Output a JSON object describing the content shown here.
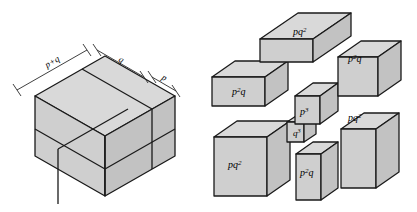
{
  "figure": {
    "colors": {
      "face_top": "#d9d9d9",
      "face_front": "#cfcfcf",
      "face_side": "#c2c2c2",
      "stroke": "#1a1a1a",
      "background": "#ffffff",
      "text": "#000000"
    }
  },
  "left_diagram": {
    "name": "subdivided-cube",
    "dimension_labels": [
      {
        "id": "edge-total",
        "text": "p+q",
        "position": "upper-left-edge"
      },
      {
        "id": "edge-q",
        "text": "q",
        "position": "upper-right-edge-long"
      },
      {
        "id": "edge-p",
        "text": "p",
        "position": "upper-right-edge-short"
      }
    ]
  },
  "right_diagram": {
    "name": "exploded-cube",
    "pieces": [
      {
        "id": "piece-top",
        "base": "pq",
        "exp": "2",
        "text": "pq2",
        "position": "top-center"
      },
      {
        "id": "piece-upper-right",
        "base": "p",
        "exp": "2",
        "text": "p2q",
        "position": "upper-right",
        "suffix": "q"
      },
      {
        "id": "piece-upper-left",
        "base": "p",
        "exp": "2",
        "text": "p2q",
        "position": "upper-left",
        "suffix": "q"
      },
      {
        "id": "piece-center-p3",
        "base": "p",
        "exp": "3",
        "text": "p3",
        "position": "center"
      },
      {
        "id": "piece-center-q3",
        "base": "q",
        "exp": "3",
        "text": "q3",
        "position": "center-lower-left"
      },
      {
        "id": "piece-mid-right",
        "base": "pq",
        "exp": "2",
        "text": "pq2",
        "position": "middle-right"
      },
      {
        "id": "piece-lower-left",
        "base": "pq",
        "exp": "2",
        "text": "pq2",
        "position": "lower-left"
      },
      {
        "id": "piece-bottom-center",
        "base": "p",
        "exp": "2",
        "text": "p2q",
        "position": "bottom-center",
        "suffix": "q"
      }
    ]
  }
}
